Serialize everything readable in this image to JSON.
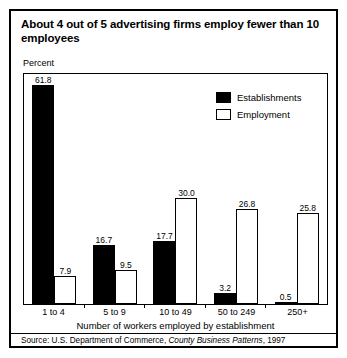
{
  "title": "About 4 out of 5 advertising firms employ fewer than 10 employees",
  "axis_unit_label": "Percent",
  "source": {
    "prefix": "Source: U.S. Department of Commerce, ",
    "italic": "County Business Patterns",
    "suffix": ", 1997"
  },
  "legend": {
    "items": [
      {
        "label": "Establishments",
        "swatch": "filled-square-icon",
        "color": "#000000"
      },
      {
        "label": "Employment",
        "swatch": "hollow-square-icon",
        "color": "#ffffff"
      }
    ]
  },
  "chart_data": {
    "type": "bar",
    "title": "About 4 out of 5 advertising firms employ fewer than 10 employees",
    "subtitle": "",
    "xlabel": "Number of workers employed by establishment",
    "ylabel": "Percent",
    "ylim": [
      0,
      65
    ],
    "grid": false,
    "legend_position": "top-right",
    "categories": [
      "1 to 4",
      "5 to 9",
      "10 to 49",
      "50 to 249",
      "250+"
    ],
    "series": [
      {
        "name": "Establishments",
        "color": "#000000",
        "values": [
          61.8,
          16.7,
          17.7,
          3.2,
          0.5
        ],
        "labels": [
          "61.8",
          "16.7",
          "17.7",
          "3.2",
          "0.5"
        ]
      },
      {
        "name": "Employment",
        "color": "#ffffff",
        "values": [
          7.9,
          9.5,
          30.0,
          26.8,
          25.8
        ],
        "labels": [
          "7.9",
          "9.5",
          "30.0",
          "26.8",
          "25.8"
        ]
      }
    ]
  }
}
